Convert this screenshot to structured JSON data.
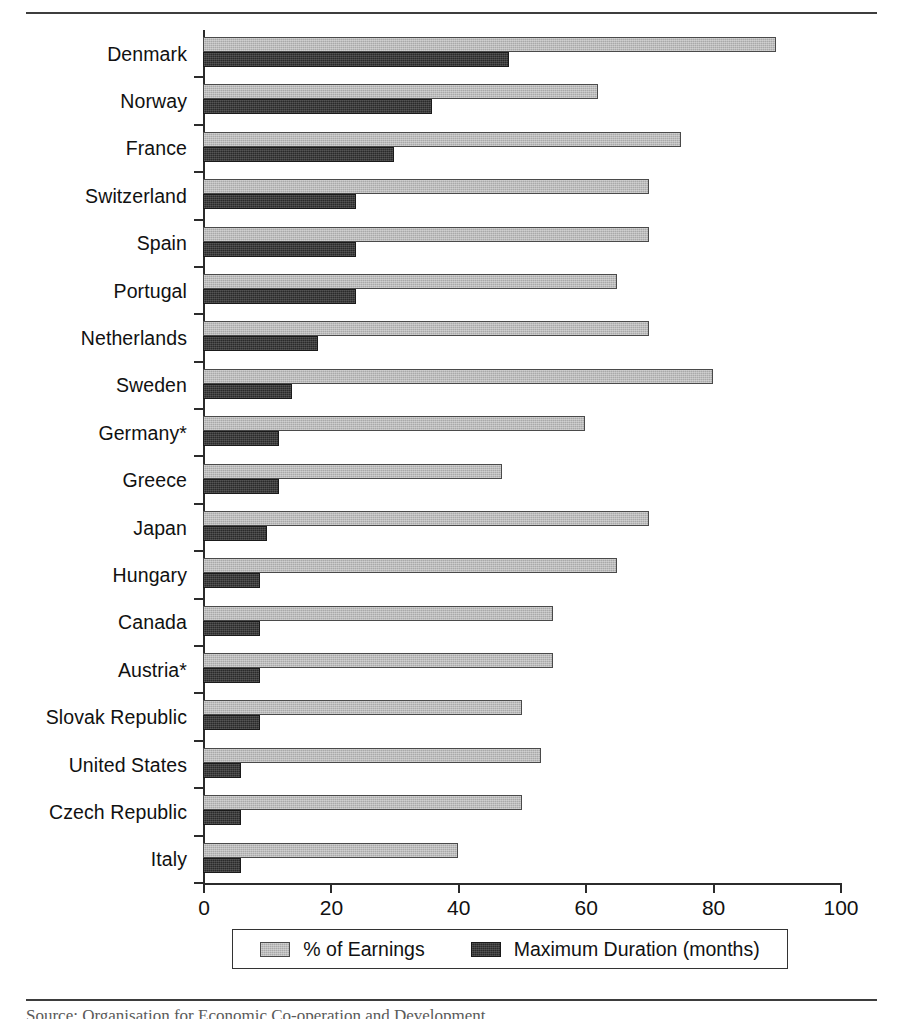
{
  "chart_data": {
    "type": "bar",
    "orientation": "horizontal",
    "title": "",
    "subtitle": "",
    "xlabel": "",
    "ylabel": "",
    "xlim": [
      0,
      100
    ],
    "xticks": [
      0,
      20,
      40,
      60,
      80,
      100
    ],
    "xtick_labels": [
      "0",
      "20",
      "40",
      "60",
      "80",
      "100"
    ],
    "grid": false,
    "legend_position": "bottom",
    "categories": [
      "Denmark",
      "Norway",
      "France",
      "Switzerland",
      "Spain",
      "Portugal",
      "Netherlands",
      "Sweden",
      "Germany*",
      "Greece",
      "Japan",
      "Hungary",
      "Canada",
      "Austria*",
      "Slovak Republic",
      "United States",
      "Czech Republic",
      "Italy"
    ],
    "series": [
      {
        "name": "% of Earnings",
        "color": "#a9a9a9",
        "values": [
          90,
          62,
          75,
          70,
          70,
          65,
          70,
          80,
          60,
          47,
          70,
          65,
          55,
          55,
          50,
          53,
          50,
          40
        ]
      },
      {
        "name": "Maximum Duration (months)",
        "color": "#2a2a2a",
        "values": [
          48,
          36,
          30,
          24,
          24,
          24,
          18,
          14,
          12,
          12,
          10,
          9,
          9,
          9,
          9,
          6,
          6,
          6
        ]
      }
    ]
  },
  "legend": {
    "items": [
      {
        "label": "% of Earnings"
      },
      {
        "label": "Maximum Duration (months)"
      }
    ]
  },
  "caption": {
    "text": "Source: Organisation for Economic Co-operation and Development"
  }
}
